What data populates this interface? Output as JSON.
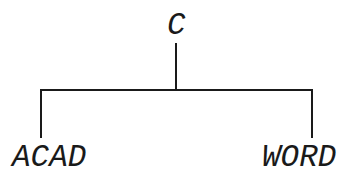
{
  "diagram": {
    "type": "tree",
    "root": {
      "label": "C"
    },
    "children": [
      {
        "label": "ACAD"
      },
      {
        "label": "WORD"
      }
    ],
    "colors": {
      "line": "#1a1a1a",
      "text": "#1a1a1a",
      "background": "#ffffff"
    }
  }
}
